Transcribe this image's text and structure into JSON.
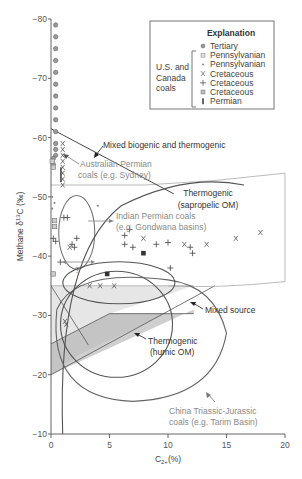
{
  "chart_data": {
    "type": "scatter",
    "title": "",
    "xlabel": "C2+(%)",
    "xlabel_main": "C",
    "xlabel_sub": "2+",
    "xlabel_tail": "(%)",
    "ylabel": "Methane δ13C (‰)",
    "ylabel_main": "Methane δ",
    "ylabel_sup": "13",
    "ylabel_tail": "C (‰)",
    "xlim": [
      0,
      20
    ],
    "ylim": [
      -80,
      -10
    ],
    "y_inverted_display": "−80 at top, −10 at bottom",
    "x_ticks": [
      "0",
      "5",
      "10",
      "15",
      "20"
    ],
    "y_ticks": [
      "−80",
      "−70",
      "−60",
      "−50",
      "−40",
      "−30",
      "−20",
      "−10"
    ],
    "grid": false,
    "legend": {
      "title": "Explanation",
      "group_label": [
        "U.S. and",
        "Canada",
        "coals"
      ],
      "position": "top-right",
      "entries": [
        {
          "marker": "circle-dot",
          "label": "Tertiary"
        },
        {
          "marker": "square-light",
          "label": "Pennsylvanian"
        },
        {
          "marker": "small-dot",
          "label": "Pennsylvanian"
        },
        {
          "marker": "x",
          "label": "Cretaceous"
        },
        {
          "marker": "plus",
          "label": "Cretaceous"
        },
        {
          "marker": "square-hatched",
          "label": "Cretaceous"
        },
        {
          "marker": "bar",
          "label": "Permian"
        }
      ]
    },
    "regions": [
      {
        "name": "Mixed biogenic and thermogenic",
        "label": "Mixed biogenic and thermogenic"
      },
      {
        "name": "Thermogenic (sapropelic OM)",
        "label_lines": [
          "Thermogenic",
          "(sapropelic OM)"
        ]
      },
      {
        "name": "Mixed source",
        "label": "Mixed source"
      },
      {
        "name": "Thermogenic (humic OM)",
        "label_lines": [
          "Thermogenic",
          "(humic OM)"
        ]
      },
      {
        "name": "Australian Permian coals",
        "label_lines": [
          "Australian Permian",
          "coals (e.g. Sydney)"
        ]
      },
      {
        "name": "Indian Permian coals",
        "label_lines": [
          "Indian Permian coals",
          "(e.g. Gondwana basins)"
        ]
      },
      {
        "name": "China Triassic-Jurassic coals",
        "label_lines": [
          "China Triassic-Jurassic",
          "coals (e.g. Tarim Basin)"
        ]
      }
    ],
    "question_mark": "?",
    "series": [
      {
        "name": "Tertiary",
        "marker": "circle-dot",
        "points": [
          [
            0.4,
            -79
          ],
          [
            0.4,
            -77
          ],
          [
            0.4,
            -75
          ],
          [
            0.4,
            -73
          ],
          [
            0.4,
            -71
          ],
          [
            0.4,
            -69
          ],
          [
            0.4,
            -67
          ],
          [
            0.4,
            -65
          ],
          [
            0.4,
            -63
          ],
          [
            0.4,
            -61
          ],
          [
            0.4,
            -59
          ],
          [
            0.4,
            -58
          ],
          [
            0.4,
            -57
          ],
          [
            0.2,
            -56.5
          ],
          [
            0.2,
            -55.5
          ]
        ]
      },
      {
        "name": "Pennsylvanian (squares)",
        "marker": "square-light",
        "points": [
          [
            0.1,
            -56
          ],
          [
            0.2,
            -55
          ],
          [
            0.3,
            -46
          ],
          [
            0.3,
            -45
          ],
          [
            0.2,
            -37
          ]
        ]
      },
      {
        "name": "Pennsylvanian (dots)",
        "marker": "small-dot",
        "points": [
          [
            0.1,
            -50
          ],
          [
            0.3,
            -49
          ],
          [
            0.1,
            -48
          ],
          [
            4,
            -48.5
          ]
        ]
      },
      {
        "name": "Cretaceous (x)",
        "marker": "x",
        "points": [
          [
            1.0,
            -59
          ],
          [
            1.0,
            -58
          ],
          [
            1.0,
            -57
          ],
          [
            1.0,
            -56
          ],
          [
            1.0,
            -55
          ],
          [
            1.0,
            -54
          ],
          [
            1.0,
            -53
          ],
          [
            1.0,
            -52
          ],
          [
            1.6,
            -41.5
          ],
          [
            3.3,
            -35
          ],
          [
            4.2,
            -35
          ],
          [
            5.4,
            -35
          ],
          [
            7.9,
            -43
          ],
          [
            11.4,
            -42
          ],
          [
            13.3,
            -42
          ],
          [
            15.8,
            -43
          ],
          [
            17.9,
            -44
          ],
          [
            1.2,
            -29
          ],
          [
            1.3,
            -28.5
          ]
        ]
      },
      {
        "name": "Cretaceous (+)",
        "marker": "plus",
        "points": [
          [
            1.1,
            -46.5
          ],
          [
            1.4,
            -46.5
          ],
          [
            0.2,
            -43
          ],
          [
            0.4,
            -42.5
          ],
          [
            0.8,
            -39
          ],
          [
            2.2,
            -43
          ],
          [
            1.8,
            -42
          ],
          [
            2.0,
            -41.5
          ],
          [
            6.7,
            -44.5
          ],
          [
            6.3,
            -43.5
          ],
          [
            6.3,
            -42
          ],
          [
            7.0,
            -41.5
          ],
          [
            9.0,
            -42
          ],
          [
            10.0,
            -42.3
          ],
          [
            11.9,
            -41.5
          ],
          [
            12.1,
            -40.5
          ],
          [
            10.2,
            -38
          ]
        ]
      },
      {
        "name": "Cretaceous (hatched squares)",
        "marker": "square-solid",
        "points": [
          [
            7.9,
            -40.5
          ],
          [
            4.8,
            -37
          ]
        ]
      },
      {
        "name": "Permian",
        "marker": "bar",
        "points": []
      }
    ]
  }
}
